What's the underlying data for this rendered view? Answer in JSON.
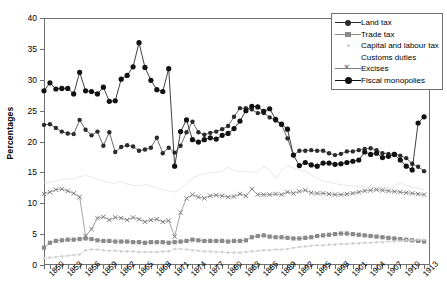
{
  "chart_data": {
    "type": "line",
    "title": "",
    "xlabel": "",
    "ylabel": "Percentages",
    "ylim": [
      0,
      40
    ],
    "yticks": [
      0,
      5,
      10,
      15,
      20,
      25,
      30,
      35,
      40
    ],
    "xlim": [
      1849,
      1914
    ],
    "grid": false,
    "legend_position": "top-right",
    "x": [
      1849,
      1850,
      1851,
      1852,
      1853,
      1854,
      1855,
      1856,
      1857,
      1858,
      1859,
      1860,
      1861,
      1862,
      1863,
      1864,
      1865,
      1866,
      1867,
      1868,
      1869,
      1870,
      1871,
      1872,
      1873,
      1874,
      1875,
      1876,
      1877,
      1878,
      1879,
      1880,
      1881,
      1882,
      1883,
      1884,
      1885,
      1886,
      1887,
      1888,
      1889,
      1890,
      1891,
      1892,
      1893,
      1894,
      1895,
      1896,
      1897,
      1898,
      1899,
      1900,
      1901,
      1902,
      1903,
      1904,
      1905,
      1906,
      1907,
      1908,
      1909,
      1910,
      1911,
      1912,
      1913
    ],
    "xtick_labels": [
      "1850",
      "1853",
      "1856",
      "1859",
      "1862",
      "1865",
      "1868",
      "1871",
      "1874",
      "1877",
      "1880",
      "1883",
      "1886",
      "1889",
      "1892",
      "1895",
      "1898",
      "1901",
      "1904",
      "1907",
      "1910",
      "1913"
    ],
    "xtick_values": [
      1850,
      1853,
      1856,
      1859,
      1862,
      1865,
      1868,
      1871,
      1874,
      1877,
      1880,
      1883,
      1886,
      1889,
      1892,
      1895,
      1898,
      1901,
      1904,
      1907,
      1910,
      1913
    ],
    "series": [
      {
        "name": "Land tax",
        "color": "#2b2b2b",
        "marker": "circle",
        "values": [
          22.7,
          22.8,
          22.2,
          21.6,
          21.3,
          21.2,
          23.5,
          21.9,
          21.0,
          21.6,
          19.3,
          21.5,
          18.3,
          19.1,
          19.4,
          19.2,
          18.5,
          18.7,
          19.0,
          20.6,
          18.1,
          19.0,
          18.2,
          19.3,
          21.5,
          23.2,
          21.5,
          21.1,
          21.4,
          21.6,
          22.0,
          22.5,
          24.0,
          25.4,
          25.4,
          25.2,
          24.6,
          24.6,
          23.9,
          23.4,
          22.7,
          20.5,
          17.8,
          18.5,
          18.5,
          18.6,
          18.5,
          18.5,
          18.1,
          17.8,
          18.0,
          18.4,
          18.4,
          18.6,
          18.8,
          18.9,
          18.6,
          18.1,
          18.0,
          18.0,
          17.7,
          17.3,
          16.4,
          15.9,
          15.2
        ]
      },
      {
        "name": "Trade tax",
        "color": "#8a8a8a",
        "marker": "square",
        "values": [
          2.8,
          3.6,
          3.9,
          4.0,
          4.1,
          4.1,
          4.2,
          4.3,
          4.2,
          4.0,
          3.9,
          3.9,
          3.8,
          3.8,
          3.8,
          3.7,
          3.7,
          3.6,
          3.7,
          3.7,
          3.7,
          3.6,
          3.7,
          3.8,
          3.9,
          4.1,
          4.0,
          3.9,
          3.9,
          3.9,
          3.9,
          3.8,
          3.9,
          3.9,
          4.0,
          4.5,
          4.7,
          4.8,
          4.6,
          4.5,
          4.5,
          4.4,
          4.3,
          4.3,
          4.4,
          4.5,
          4.7,
          4.8,
          4.9,
          5.0,
          5.1,
          5.1,
          5.0,
          4.9,
          4.8,
          4.7,
          4.6,
          4.5,
          4.4,
          4.3,
          4.2,
          4.1,
          4.0,
          3.9,
          3.8
        ]
      },
      {
        "name": "Capital and labour tax",
        "color": "#cfcfcf",
        "marker": "dot",
        "values": [
          1.1,
          1.2,
          1.3,
          1.4,
          1.5,
          1.6,
          1.7,
          2.4,
          2.5,
          2.5,
          2.4,
          2.3,
          2.3,
          2.2,
          2.2,
          2.2,
          2.1,
          2.1,
          2.1,
          2.1,
          2.2,
          2.2,
          2.6,
          2.6,
          2.5,
          2.4,
          2.3,
          2.2,
          2.2,
          2.1,
          2.1,
          2.0,
          2.0,
          2.0,
          2.1,
          2.2,
          2.3,
          2.4,
          2.4,
          2.5,
          2.5,
          2.6,
          2.8,
          2.9,
          3.0,
          3.1,
          3.2,
          3.2,
          3.3,
          3.3,
          3.4,
          3.4,
          3.5,
          3.5,
          3.6,
          3.6,
          3.7,
          3.7,
          3.8,
          3.8,
          3.9,
          4.0,
          4.0,
          4.1,
          4.1
        ]
      },
      {
        "name": "Customs duties",
        "color": "#dcdcdc",
        "marker": "none",
        "values": [
          13.3,
          13.4,
          13.6,
          13.8,
          14.0,
          13.9,
          14.3,
          14.5,
          14.2,
          13.9,
          13.6,
          13.4,
          13.2,
          13.5,
          13.1,
          12.9,
          12.8,
          13.0,
          12.8,
          12.5,
          12.2,
          12.0,
          11.8,
          12.4,
          13.2,
          14.0,
          14.5,
          14.8,
          15.0,
          15.0,
          15.2,
          15.9,
          15.3,
          15.1,
          15.2,
          15.1,
          15.0,
          16.0,
          15.5,
          14.0,
          15.3,
          16.1,
          15.7,
          15.4,
          15.2,
          14.6,
          14.0,
          13.6,
          13.4,
          13.2,
          13.0,
          12.9,
          12.8,
          12.7,
          12.6,
          12.6,
          12.5,
          12.5,
          12.5,
          12.8,
          13.4,
          12.9,
          12.6,
          12.4,
          12.2
        ]
      },
      {
        "name": "Excises",
        "color": "#7d7d7d",
        "marker": "x",
        "values": [
          11.5,
          11.8,
          12.2,
          12.3,
          12.0,
          11.6,
          11.0,
          4.7,
          5.8,
          7.6,
          7.8,
          7.3,
          7.7,
          7.6,
          7.3,
          7.7,
          7.4,
          7.0,
          7.3,
          7.4,
          7.0,
          7.2,
          4.6,
          8.5,
          10.8,
          11.4,
          11.0,
          10.8,
          11.2,
          11.3,
          11.2,
          11.0,
          11.1,
          11.5,
          11.2,
          12.3,
          11.4,
          11.4,
          11.4,
          11.5,
          11.4,
          11.8,
          11.6,
          11.9,
          12.1,
          11.7,
          11.6,
          11.6,
          11.5,
          11.4,
          11.4,
          11.5,
          11.6,
          11.8,
          12.0,
          12.1,
          12.2,
          12.1,
          12.0,
          11.9,
          11.8,
          11.7,
          11.6,
          11.5,
          11.4
        ]
      },
      {
        "name": "Fiscal monopolies",
        "color": "#111111",
        "marker": "circle-bold",
        "values": [
          28.2,
          29.5,
          28.5,
          28.6,
          28.6,
          27.7,
          31.2,
          28.2,
          28.1,
          27.7,
          28.8,
          26.5,
          26.6,
          30.1,
          30.7,
          32.1,
          36.0,
          32.0,
          29.9,
          28.4,
          28.1,
          31.8,
          16.0,
          21.6,
          23.5,
          20.3,
          19.9,
          20.3,
          20.6,
          20.4,
          21.0,
          21.3,
          22.1,
          23.3,
          25.0,
          25.7,
          25.6,
          24.9,
          25.3,
          23.6,
          22.8,
          22.0,
          17.8,
          16.1,
          16.6,
          16.2,
          16.0,
          16.5,
          16.5,
          16.3,
          16.4,
          16.6,
          16.8,
          17.0,
          18.3,
          17.9,
          18.1,
          17.4,
          17.6,
          17.9,
          17.0,
          16.0,
          15.4,
          23.0,
          24.0
        ]
      }
    ]
  }
}
